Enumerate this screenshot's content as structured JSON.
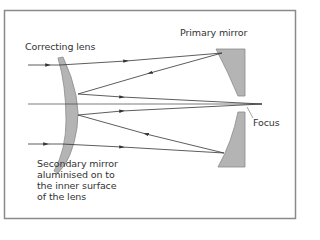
{
  "diagram": {
    "labels": {
      "correcting_lens": "Correcting lens",
      "primary_mirror": "Primary mirror",
      "focus": "Focus",
      "secondary_mirror_line1": "Secondary mirror",
      "secondary_mirror_line2": "aluminised on to",
      "secondary_mirror_line3": "the inner surface",
      "secondary_mirror_line4": "of the lens"
    },
    "colors": {
      "frame": "#8a8a8a",
      "optics_fill": "#b4b4b4",
      "optics_stroke": "#8c8c8c",
      "ray": "#333333",
      "text": "#333333"
    }
  }
}
